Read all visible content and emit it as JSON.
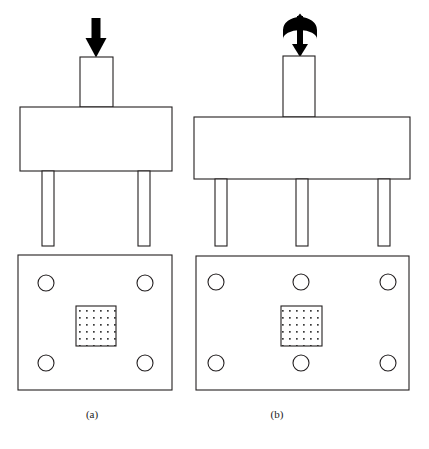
{
  "figure": {
    "type": "engineering-diagram",
    "background_color": "#ffffff",
    "stroke_color": "#231f20",
    "arrow_fill": "#000000",
    "stipple_dot_color": "#3a3a3a",
    "width": 429,
    "height": 449,
    "panels": [
      {
        "id": "a",
        "caption": "(a)",
        "load_symbol": "downward-arrow",
        "load_description": "single vertical downward force",
        "punch_column": {
          "x": 80,
          "y": 57,
          "width": 33,
          "height": 50
        },
        "main_block": {
          "x": 20,
          "y": 107,
          "width": 152,
          "height": 64
        },
        "legs": [
          {
            "x": 42,
            "y": 171,
            "width": 12,
            "height": 75
          },
          {
            "x": 138,
            "y": 171,
            "width": 12,
            "height": 75
          }
        ],
        "base_plate": {
          "x": 18,
          "y": 255,
          "width": 154,
          "height": 135
        },
        "hole_count": 4,
        "holes": [
          {
            "cx": 46,
            "cy": 283,
            "r": 8
          },
          {
            "cx": 145,
            "cy": 283,
            "r": 8
          },
          {
            "cx": 46,
            "cy": 363,
            "r": 8
          },
          {
            "cx": 145,
            "cy": 363,
            "r": 8
          }
        ],
        "stipple_square": {
          "x": 76,
          "y": 306,
          "width": 40,
          "height": 40
        },
        "arrow": {
          "x": 96,
          "y": 18,
          "tip_y": 57,
          "shaft_width": 9,
          "head_width": 21,
          "head_height": 20
        }
      },
      {
        "id": "b",
        "caption": "(b)",
        "load_symbol": "double-arrow-with-rotation-arc",
        "load_description": "combined axial force and torsional moment",
        "punch_column": {
          "x": 283,
          "y": 56,
          "width": 32,
          "height": 61
        },
        "main_block": {
          "x": 194,
          "y": 117,
          "width": 216,
          "height": 62
        },
        "legs": [
          {
            "x": 215,
            "y": 179,
            "width": 12,
            "height": 67
          },
          {
            "x": 296,
            "y": 179,
            "width": 12,
            "height": 67
          },
          {
            "x": 378,
            "y": 179,
            "width": 12,
            "height": 67
          }
        ],
        "base_plate": {
          "x": 196,
          "y": 256,
          "width": 213,
          "height": 134
        },
        "hole_count": 6,
        "holes": [
          {
            "cx": 216,
            "cy": 282,
            "r": 8
          },
          {
            "cx": 301,
            "cy": 282,
            "r": 8
          },
          {
            "cx": 388,
            "cy": 282,
            "r": 8
          },
          {
            "cx": 216,
            "cy": 363,
            "r": 8
          },
          {
            "cx": 301,
            "cy": 363,
            "r": 8
          },
          {
            "cx": 388,
            "cy": 363,
            "r": 8
          }
        ],
        "stipple_square": {
          "x": 281,
          "y": 306,
          "width": 41,
          "height": 40
        },
        "arrow": {
          "x": 300,
          "y": 14,
          "tip_y": 56,
          "shaft_width": 6,
          "head_width": 18,
          "head_height": 14
        }
      }
    ]
  }
}
